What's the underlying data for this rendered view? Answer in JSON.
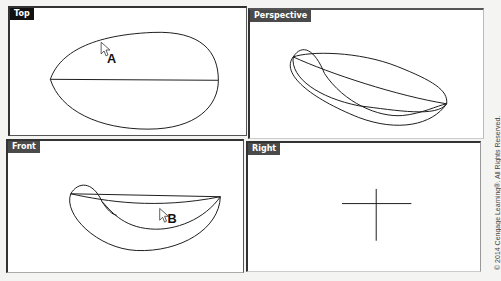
{
  "viewports": {
    "top": {
      "label": "Top",
      "callout": "A"
    },
    "perspective": {
      "label": "Perspective"
    },
    "front": {
      "label": "Front",
      "callout": "B"
    },
    "right": {
      "label": "Right"
    }
  },
  "copyright": "© 2014 Cengage Learning®. All Rights Reserved."
}
